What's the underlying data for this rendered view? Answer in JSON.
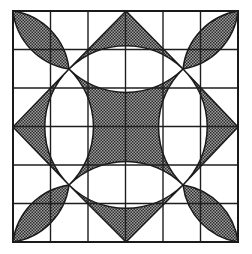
{
  "figure": {
    "colors": {
      "background": "#ffffff",
      "line": "#1a1a1a",
      "hatch_dark": "#2a2a2a",
      "hatch_light": "#9a9a9a"
    },
    "grid": {
      "rows": 6,
      "cols": 6,
      "x_lines": [
        13,
        50.5,
        88,
        125.5,
        163,
        200.5,
        238
      ],
      "y_lines": [
        11,
        49.5,
        88,
        126.5,
        165,
        203.5,
        242
      ]
    },
    "crossing_points": [
      [
        69,
        69
      ],
      [
        183,
        69
      ],
      [
        183,
        185
      ],
      [
        69,
        185
      ]
    ],
    "shaded_regions": [
      "petal-top-left",
      "petal-top-right",
      "petal-bottom-right",
      "petal-bottom-left",
      "triangle-top",
      "triangle-right",
      "triangle-bottom",
      "triangle-left",
      "central-concave-square"
    ],
    "white_regions": [
      "eye-top",
      "eye-right",
      "eye-bottom",
      "eye-left"
    ]
  }
}
